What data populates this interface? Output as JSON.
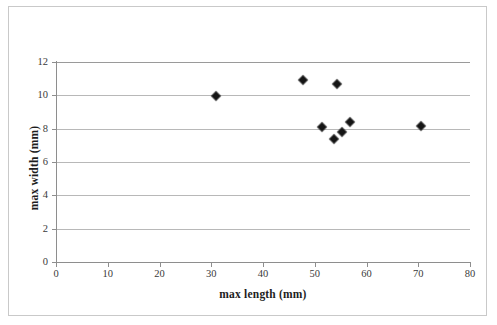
{
  "chart_data": {
    "type": "scatter",
    "title": "",
    "xlabel": "max length (mm)",
    "ylabel": "max width (mm)",
    "xlim": [
      0,
      80
    ],
    "ylim": [
      0,
      12
    ],
    "xticks": [
      0,
      10,
      20,
      30,
      40,
      50,
      60,
      70,
      80
    ],
    "yticks": [
      0,
      2,
      4,
      6,
      8,
      10,
      12
    ],
    "grid": "horizontal",
    "legend": "none",
    "series": [
      {
        "name": "specimens",
        "marker": "diamond",
        "color": "#111111",
        "points": [
          {
            "x": 30.9,
            "y": 9.95
          },
          {
            "x": 47.7,
            "y": 10.9
          },
          {
            "x": 54.3,
            "y": 10.7
          },
          {
            "x": 51.4,
            "y": 8.1
          },
          {
            "x": 53.7,
            "y": 7.4
          },
          {
            "x": 55.2,
            "y": 7.8
          },
          {
            "x": 56.9,
            "y": 8.4
          },
          {
            "x": 70.6,
            "y": 8.15
          }
        ]
      }
    ]
  },
  "axis": {
    "x_tick_labels": [
      "0",
      "10",
      "20",
      "30",
      "40",
      "50",
      "60",
      "70",
      "80"
    ],
    "y_tick_labels": [
      "0",
      "2",
      "4",
      "6",
      "8",
      "10",
      "12"
    ],
    "x_title": "max length (mm)",
    "y_title": "max width (mm)"
  }
}
